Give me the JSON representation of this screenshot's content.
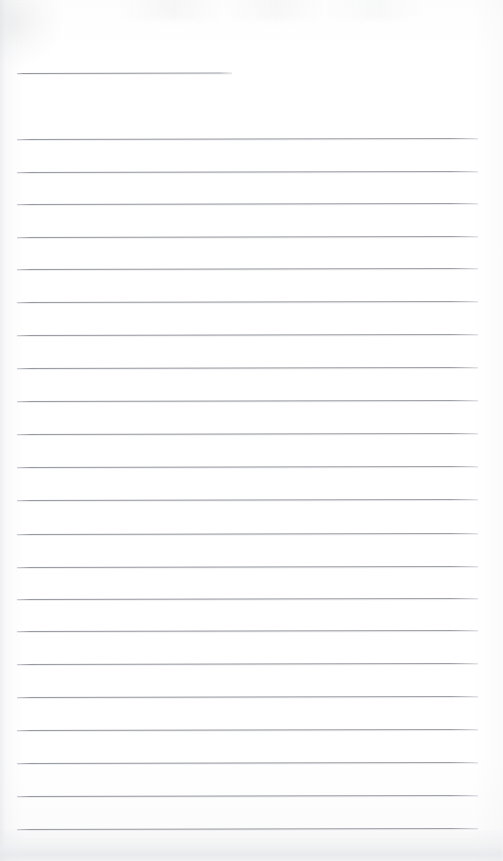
{
  "document": {
    "kind": "scanned-lined-paper",
    "title": "Blank lined notebook page",
    "page_width": 503,
    "page_height": 861,
    "background_color": "#fefefe",
    "rule_color": "#8f9198",
    "rule_thickness_px": 1,
    "content_text": "",
    "has_handwriting": false,
    "has_printed_text": false
  },
  "layout": {
    "rule_left_x": 17,
    "rule_right_x": 478,
    "short_rule_right_x": 232,
    "rule_spacing_px": 32.6,
    "first_rule_y": 73,
    "last_rule_y": 829,
    "rule_count": 24
  },
  "rules": [
    {
      "id": "rule-1",
      "y": 73,
      "x": 17,
      "width": 215,
      "short": true
    },
    {
      "id": "rule-2",
      "y": 139,
      "x": 17,
      "width": 461,
      "short": false
    },
    {
      "id": "rule-3",
      "y": 172,
      "x": 17,
      "width": 461,
      "short": false
    },
    {
      "id": "rule-4",
      "y": 204,
      "x": 17,
      "width": 461,
      "short": false
    },
    {
      "id": "rule-5",
      "y": 237,
      "x": 17,
      "width": 461,
      "short": false
    },
    {
      "id": "rule-6",
      "y": 269,
      "x": 17,
      "width": 461,
      "short": false
    },
    {
      "id": "rule-7",
      "y": 302,
      "x": 17,
      "width": 461,
      "short": false
    },
    {
      "id": "rule-8",
      "y": 335,
      "x": 17,
      "width": 461,
      "short": false
    },
    {
      "id": "rule-9",
      "y": 368,
      "x": 17,
      "width": 461,
      "short": false
    },
    {
      "id": "rule-10",
      "y": 401,
      "x": 17,
      "width": 461,
      "short": false
    },
    {
      "id": "rule-11",
      "y": 434,
      "x": 17,
      "width": 461,
      "short": false
    },
    {
      "id": "rule-12",
      "y": 467,
      "x": 17,
      "width": 461,
      "short": false
    },
    {
      "id": "rule-13",
      "y": 500,
      "x": 17,
      "width": 461,
      "short": false
    },
    {
      "id": "rule-14",
      "y": 534,
      "x": 17,
      "width": 461,
      "short": false
    },
    {
      "id": "rule-15",
      "y": 567,
      "x": 17,
      "width": 461,
      "short": false
    },
    {
      "id": "rule-16",
      "y": 599,
      "x": 17,
      "width": 461,
      "short": false
    },
    {
      "id": "rule-17",
      "y": 631,
      "x": 17,
      "width": 461,
      "short": false
    },
    {
      "id": "rule-18",
      "y": 664,
      "x": 17,
      "width": 461,
      "short": false
    },
    {
      "id": "rule-19",
      "y": 697,
      "x": 17,
      "width": 461,
      "short": false
    },
    {
      "id": "rule-20",
      "y": 730,
      "x": 17,
      "width": 461,
      "short": false
    },
    {
      "id": "rule-21",
      "y": 763,
      "x": 17,
      "width": 461,
      "short": false
    },
    {
      "id": "rule-22",
      "y": 796,
      "x": 17,
      "width": 461,
      "short": false
    },
    {
      "id": "rule-23",
      "y": 829,
      "x": 17,
      "width": 461,
      "short": false
    }
  ]
}
